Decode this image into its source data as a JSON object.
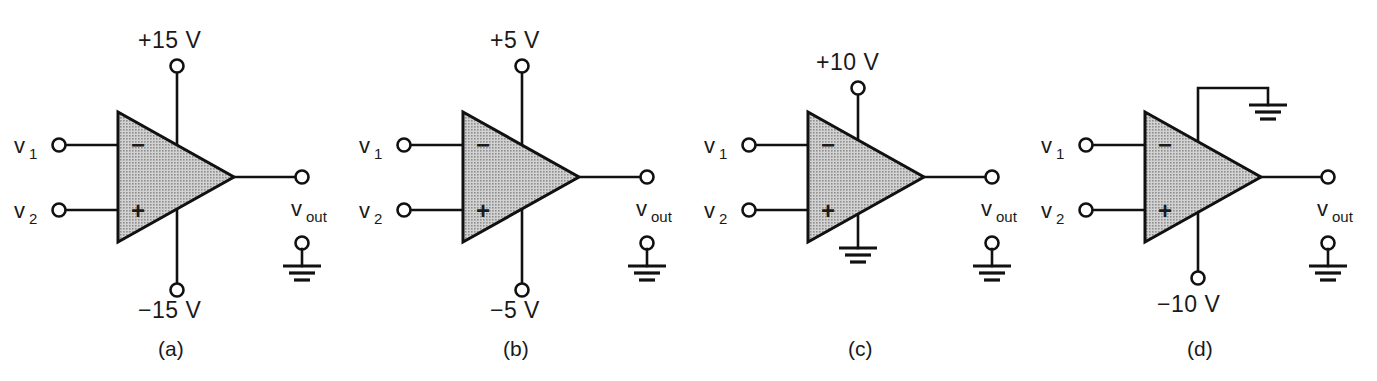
{
  "figure": {
    "type": "op-amp power-supply connection diagrams",
    "panel_count": 4,
    "background_color": "#ffffff",
    "line_color": "#111111",
    "triangle_fill_color": "#b8b8b8"
  },
  "common": {
    "input1_label": "v",
    "input1_sub": "1",
    "input2_label": "v",
    "input2_sub": "2",
    "output_label": "v",
    "output_sub": "out",
    "inverting_sign": "−",
    "noninverting_sign": "+",
    "ground_icon": "ground-icon",
    "terminal_icon": "terminal-node-icon"
  },
  "panels": [
    {
      "id": "a",
      "caption": "(a)",
      "top_rail": {
        "label": "+15 V",
        "kind": "terminal"
      },
      "bottom_rail": {
        "label": "−15 V",
        "kind": "terminal"
      },
      "top_ground": false,
      "output_reference": "ground"
    },
    {
      "id": "b",
      "caption": "(b)",
      "top_rail": {
        "label": "+5 V",
        "kind": "terminal"
      },
      "bottom_rail": {
        "label": "−5 V",
        "kind": "terminal"
      },
      "top_ground": false,
      "output_reference": "ground"
    },
    {
      "id": "c",
      "caption": "(c)",
      "top_rail": {
        "label": "+10 V",
        "kind": "terminal"
      },
      "bottom_rail": {
        "label": "",
        "kind": "ground"
      },
      "top_ground": false,
      "output_reference": "ground"
    },
    {
      "id": "d",
      "caption": "(d)",
      "top_rail": {
        "label": "",
        "kind": "ground-elbow"
      },
      "bottom_rail": {
        "label": "−10 V",
        "kind": "terminal"
      },
      "top_ground": true,
      "output_reference": "ground"
    }
  ]
}
